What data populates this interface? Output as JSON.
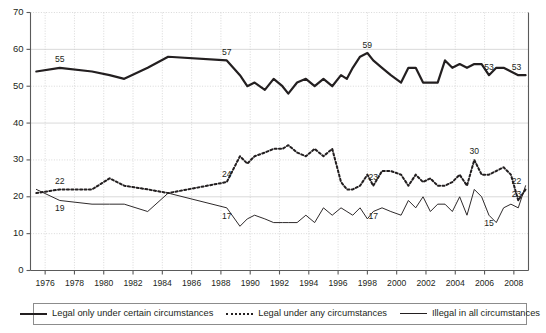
{
  "chart_data": {
    "type": "line",
    "title": "",
    "subtitle": "",
    "xlabel": "",
    "ylabel": "",
    "xlim": [
      1975,
      2009
    ],
    "ylim": [
      0,
      70
    ],
    "grid": true,
    "legend_position": "bottom",
    "y_ticks": [
      0,
      10,
      20,
      30,
      40,
      50,
      60,
      70
    ],
    "y_tick_labels": [
      "0",
      "10",
      "20",
      "30",
      "40",
      "50",
      "60",
      "70"
    ],
    "x_ticks": [
      1976,
      1978,
      1980,
      1982,
      1984,
      1986,
      1988,
      1990,
      1992,
      1994,
      1996,
      1998,
      2000,
      2002,
      2004,
      2006,
      2008
    ],
    "x_tick_labels": [
      "1976",
      "1978",
      "1980",
      "1982",
      "1984",
      "1986",
      "1988",
      "1990",
      "1992",
      "1994",
      "1996",
      "1998",
      "2000",
      "2002",
      "2004",
      "2006",
      "2008"
    ],
    "series": [
      {
        "name": "Legal only under certain circumstances",
        "style": "solid-thick",
        "color": "#231f20",
        "x": [
          1975.4,
          1977.0,
          1979.2,
          1980.4,
          1981.4,
          1983.0,
          1984.4,
          1988.4,
          1989.3,
          1989.8,
          1990.3,
          1991.0,
          1991.6,
          1992.2,
          1992.6,
          1993.2,
          1993.8,
          1994.4,
          1995.0,
          1995.6,
          1996.2,
          1996.6,
          1997.0,
          1997.5,
          1998.0,
          1998.4,
          1999.0,
          1999.6,
          2000.3,
          2000.8,
          2001.3,
          2001.8,
          2002.3,
          2002.8,
          2003.3,
          2003.8,
          2004.3,
          2004.8,
          2005.3,
          2005.8,
          2006.3,
          2006.8,
          2007.3,
          2007.8,
          2008.3,
          2008.8
        ],
        "values": [
          54,
          55,
          54,
          53,
          52,
          55,
          58,
          57,
          53,
          50,
          51,
          49,
          52,
          50,
          48,
          51,
          52,
          50,
          52,
          50,
          53,
          52,
          55,
          58,
          59,
          57,
          55,
          53,
          51,
          55,
          55,
          51,
          51,
          51,
          57,
          55,
          56,
          55,
          56,
          56,
          53,
          55,
          55,
          54,
          53,
          53
        ]
      },
      {
        "name": "Legal under any circumstances",
        "style": "dotted",
        "color": "#231f20",
        "x": [
          1975.4,
          1977.0,
          1979.2,
          1980.4,
          1981.4,
          1983.0,
          1984.4,
          1988.4,
          1989.3,
          1989.8,
          1990.3,
          1991.0,
          1991.6,
          1992.2,
          1992.6,
          1993.2,
          1993.8,
          1994.4,
          1995.0,
          1995.6,
          1996.2,
          1996.6,
          1997.0,
          1997.5,
          1998.0,
          1998.4,
          1999.0,
          1999.6,
          2000.3,
          2000.8,
          2001.3,
          2001.8,
          2002.3,
          2002.8,
          2003.3,
          2003.8,
          2004.3,
          2004.8,
          2005.3,
          2005.8,
          2006.3,
          2006.8,
          2007.3,
          2007.8,
          2008.3,
          2008.8
        ],
        "values": [
          21,
          22,
          22,
          25,
          23,
          22,
          21,
          24,
          31,
          29,
          31,
          32,
          33,
          33,
          34,
          32,
          31,
          33,
          31,
          33,
          24,
          22,
          22,
          23,
          26,
          23,
          27,
          27,
          26,
          23,
          26,
          24,
          25,
          23,
          23,
          24,
          26,
          23,
          30,
          26,
          26,
          27,
          28,
          26,
          19,
          22
        ]
      },
      {
        "name": "Illegal in all circumstances",
        "style": "solid-thin",
        "color": "#231f20",
        "x": [
          1975.4,
          1977.0,
          1979.2,
          1980.4,
          1981.4,
          1983.0,
          1984.4,
          1988.4,
          1989.3,
          1989.8,
          1990.3,
          1991.0,
          1991.6,
          1992.2,
          1992.6,
          1993.2,
          1993.8,
          1994.4,
          1995.0,
          1995.6,
          1996.2,
          1996.6,
          1997.0,
          1997.5,
          1998.0,
          1998.4,
          1999.0,
          1999.6,
          2000.3,
          2000.8,
          2001.3,
          2001.8,
          2002.3,
          2002.8,
          2003.3,
          2003.8,
          2004.3,
          2004.8,
          2005.3,
          2005.8,
          2006.3,
          2006.8,
          2007.3,
          2007.8,
          2008.3,
          2008.8
        ],
        "values": [
          22,
          19,
          18,
          18,
          18,
          16,
          21,
          17,
          12,
          14,
          15,
          14,
          13,
          13,
          13,
          13,
          15,
          13,
          17,
          15,
          17,
          16,
          15,
          17,
          14,
          16,
          17,
          16,
          15,
          19,
          17,
          20,
          16,
          18,
          18,
          16,
          20,
          15,
          22,
          20,
          15,
          13,
          17,
          18,
          17,
          23
        ]
      }
    ],
    "annotations": [
      {
        "text": "55",
        "series": "Legal only under certain circumstances",
        "x": 1977.0,
        "y": 55
      },
      {
        "text": "57",
        "series": "Legal only under certain circumstances",
        "x": 1988.4,
        "y": 57
      },
      {
        "text": "59",
        "series": "Legal only under certain circumstances",
        "x": 1998.0,
        "y": 59
      },
      {
        "text": "53",
        "series": "Legal only under certain circumstances",
        "x": 2006.3,
        "y": 53
      },
      {
        "text": "53",
        "series": "Legal only under certain circumstances",
        "x": 2008.8,
        "y": 53
      },
      {
        "text": "22",
        "series": "Legal under any circumstances",
        "x": 1977.0,
        "y": 22
      },
      {
        "text": "24",
        "series": "Legal under any circumstances",
        "x": 1988.4,
        "y": 24
      },
      {
        "text": "23",
        "series": "Legal under any circumstances",
        "x": 1998.4,
        "y": 23
      },
      {
        "text": "30",
        "series": "Legal under any circumstances",
        "x": 2005.3,
        "y": 30
      },
      {
        "text": "22",
        "series": "Legal under any circumstances",
        "x": 2008.8,
        "y": 22
      },
      {
        "text": "19",
        "series": "Illegal in all circumstances",
        "x": 1977.0,
        "y": 19
      },
      {
        "text": "17",
        "series": "Illegal in all circumstances",
        "x": 1988.4,
        "y": 17
      },
      {
        "text": "17",
        "series": "Illegal in all circumstances",
        "x": 1998.4,
        "y": 17
      },
      {
        "text": "15",
        "series": "Illegal in all circumstances",
        "x": 2006.3,
        "y": 15
      },
      {
        "text": "23",
        "series": "Illegal in all circumstances",
        "x": 2008.8,
        "y": 23
      }
    ]
  },
  "legend": {
    "items": [
      {
        "label": "Legal only under certain circumstances",
        "style": "solid-thick"
      },
      {
        "label": "Legal under any circumstances",
        "style": "dotted"
      },
      {
        "label": "Illegal in all circumstances",
        "style": "solid-thin"
      }
    ]
  },
  "colors": {
    "ink": "#231f20",
    "grid": "#c9c9c9",
    "axis": "#5a5a5a",
    "background": "#ffffff"
  }
}
